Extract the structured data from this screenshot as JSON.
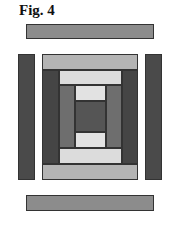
{
  "figure": {
    "title": "Fig. 4"
  },
  "colors": {
    "bar": "#8c8c8c",
    "side": "#4a4a4a",
    "light_gray": "#b4b4b4",
    "very_light": "#dcdcdc",
    "medium": "#6e6e6e",
    "dark": "#454545"
  },
  "pieces": [
    {
      "name": "top-bar",
      "x": 26,
      "y": 24,
      "w": 128,
      "h": 15,
      "color": "#8c8c8c"
    },
    {
      "name": "left-side-bar",
      "x": 18,
      "y": 54,
      "w": 17,
      "h": 126,
      "color": "#4a4a4a"
    },
    {
      "name": "right-side-bar",
      "x": 145,
      "y": 54,
      "w": 17,
      "h": 126,
      "color": "#4a4a4a"
    },
    {
      "name": "bottom-bar",
      "x": 26,
      "y": 195,
      "w": 128,
      "h": 16,
      "color": "#8c8c8c"
    },
    {
      "name": "block-top-strip",
      "x": 42,
      "y": 54,
      "w": 96,
      "h": 16,
      "color": "#b4b4b4"
    },
    {
      "name": "block-bottom-strip",
      "x": 42,
      "y": 164,
      "w": 96,
      "h": 16,
      "color": "#b4b4b4"
    },
    {
      "name": "block-left-dark",
      "x": 42,
      "y": 70,
      "w": 17,
      "h": 94,
      "color": "#454545"
    },
    {
      "name": "block-right-dark",
      "x": 122,
      "y": 70,
      "w": 16,
      "h": 94,
      "color": "#454545"
    },
    {
      "name": "inner-top-light",
      "x": 59,
      "y": 70,
      "w": 63,
      "h": 15,
      "color": "#dcdcdc"
    },
    {
      "name": "inner-bottom-light",
      "x": 59,
      "y": 148,
      "w": 63,
      "h": 16,
      "color": "#dcdcdc"
    },
    {
      "name": "inner-left-medium",
      "x": 59,
      "y": 85,
      "w": 16,
      "h": 63,
      "color": "#6e6e6e"
    },
    {
      "name": "inner-right-medium",
      "x": 106,
      "y": 85,
      "w": 16,
      "h": 63,
      "color": "#6e6e6e"
    },
    {
      "name": "core-top-light",
      "x": 75,
      "y": 85,
      "w": 31,
      "h": 16,
      "color": "#e2e2e2"
    },
    {
      "name": "core-bottom-light",
      "x": 75,
      "y": 132,
      "w": 31,
      "h": 16,
      "color": "#e2e2e2"
    },
    {
      "name": "core-center-dark",
      "x": 75,
      "y": 101,
      "w": 31,
      "h": 31,
      "color": "#555555"
    }
  ]
}
